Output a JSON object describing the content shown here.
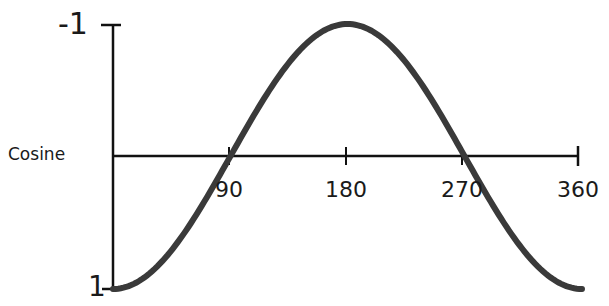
{
  "chart_data": {
    "type": "line",
    "title": "",
    "series_label": "Cosine",
    "xlabel": "",
    "ylabel": "Cosine",
    "x_ticks": [
      "90",
      "180",
      "270",
      "360"
    ],
    "y_ticks": [
      "-1",
      "1"
    ],
    "ylim": [
      1,
      -1
    ],
    "xlim": [
      0,
      360
    ],
    "y_axis_inverted": true,
    "grid": false,
    "legend": "none",
    "series": [
      {
        "name": "Cosine",
        "x": [
          0,
          45,
          90,
          135,
          180,
          225,
          270,
          315,
          360
        ],
        "values": [
          1,
          0.707,
          0,
          -0.707,
          -1,
          -0.707,
          0,
          0.707,
          1
        ]
      }
    ],
    "colors": {
      "curve": "#3a3a3a",
      "axes": "#111111",
      "text": "#1a1a1a"
    }
  },
  "labels": {
    "y_top": "-1",
    "y_bottom": "1",
    "series": "Cosine",
    "x90": "90",
    "x180": "180",
    "x270": "270",
    "x360": "360"
  }
}
